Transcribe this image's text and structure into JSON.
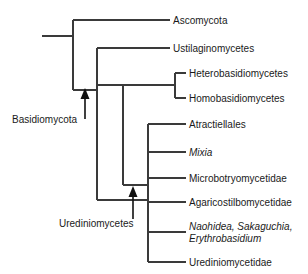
{
  "figure": {
    "type": "phylogenetic-tree",
    "orientation": "left-to-right-cladogram",
    "background_color": "#ffffff",
    "line_color": "#3a3a3a",
    "text_color": "#1a1a1a"
  },
  "tips": [
    {
      "id": "ascomycota",
      "label": "Ascomycota",
      "italic": false,
      "y": 20
    },
    {
      "id": "ustilaginomycetes",
      "label": "Ustilaginomycetes",
      "italic": false,
      "y": 48
    },
    {
      "id": "heterobasidiomycetes",
      "label": "Heterobasidiomycetes",
      "italic": false,
      "y": 73
    },
    {
      "id": "homobasidiomycetes",
      "label": "Homobasidiomycetes",
      "italic": false,
      "y": 98
    },
    {
      "id": "atractiellales",
      "label": "Atractiellales",
      "italic": false,
      "y": 124
    },
    {
      "id": "mixia",
      "label": "Mixia",
      "italic": true,
      "y": 152
    },
    {
      "id": "microbotryomycetidae",
      "label": "Microbotryomycetidae",
      "italic": false,
      "y": 178
    },
    {
      "id": "agaricostilbomycetidae",
      "label": "Agaricostilbomycetidae",
      "italic": false,
      "y": 202
    },
    {
      "id": "naohidea-group",
      "label": "Naohidea, Sakaguchia,",
      "label_line2": "Erythrobasidium",
      "italic": true,
      "y": 226
    },
    {
      "id": "urediniomycetidae",
      "label": "Urediniomycetidae",
      "italic": false,
      "y": 262
    }
  ],
  "clade_annotations": [
    {
      "id": "basidiomycota",
      "label": "Basidiomycota",
      "arrow_direction": "up",
      "target_node_y": 90
    },
    {
      "id": "urediniomycetes",
      "label": "Urediniomycetes",
      "arrow_direction": "up",
      "target_node_y": 187
    }
  ]
}
